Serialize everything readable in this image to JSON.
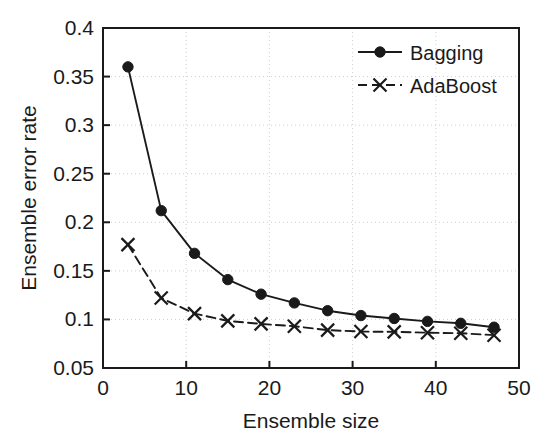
{
  "chart_data": {
    "type": "line",
    "title": "",
    "xlabel": "Ensemble size",
    "ylabel": "Ensemble error rate",
    "xlim": [
      0,
      50
    ],
    "ylim": [
      0.05,
      0.4
    ],
    "xticks": [
      0,
      10,
      20,
      30,
      40,
      50
    ],
    "xtick_labels": [
      "0",
      "10",
      "20",
      "30",
      "40",
      "50"
    ],
    "yticks": [
      0.05,
      0.1,
      0.15,
      0.2,
      0.25,
      0.3,
      0.35,
      0.4
    ],
    "ytick_labels": [
      "0.05",
      "0.1",
      "0.15",
      "0.2",
      "0.25",
      "0.3",
      "0.35",
      "0.4"
    ],
    "grid": true,
    "grid_style": "dotted",
    "legend_position": "top-right",
    "x": [
      3,
      7,
      11,
      15,
      19,
      23,
      27,
      31,
      35,
      39,
      43,
      47
    ],
    "series": [
      {
        "name": "Bagging",
        "marker": "filled-circle",
        "linestyle": "solid",
        "color": "#1a1a1a",
        "values": [
          0.36,
          0.212,
          0.168,
          0.141,
          0.126,
          0.117,
          0.109,
          0.104,
          0.101,
          0.098,
          0.096,
          0.092
        ]
      },
      {
        "name": "AdaBoost",
        "marker": "cross-x",
        "linestyle": "dashed",
        "color": "#1a1a1a",
        "values": [
          0.177,
          0.122,
          0.106,
          0.0985,
          0.0954,
          0.093,
          0.089,
          0.0875,
          0.0872,
          0.0863,
          0.0858,
          0.0838
        ]
      }
    ]
  },
  "legend": {
    "items": [
      {
        "label": "Bagging"
      },
      {
        "label": "AdaBoost"
      }
    ]
  },
  "axes": {
    "x_title": "Ensemble size",
    "y_title": "Ensemble error rate"
  }
}
